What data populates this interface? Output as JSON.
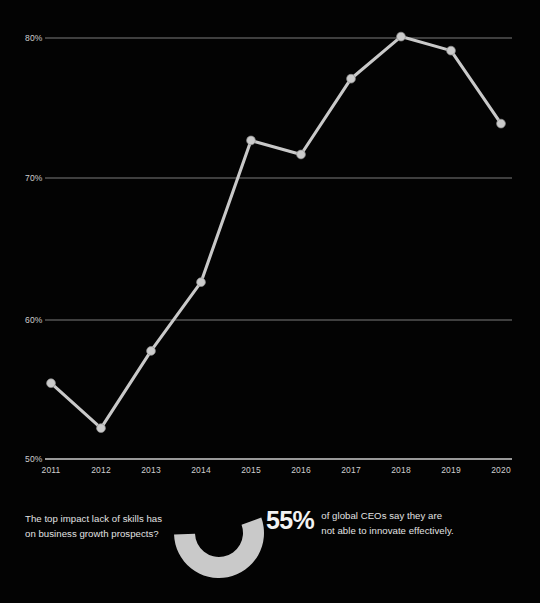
{
  "chart_data": {
    "type": "line",
    "title": "",
    "subtitle": "",
    "xlabel": "",
    "ylabel": "",
    "categories": [
      "2011",
      "2012",
      "2013",
      "2014",
      "2015",
      "2016",
      "2017",
      "2018",
      "2019",
      "2020"
    ],
    "series": [
      {
        "name": "CEOs confident in growth prospects",
        "values": [
          55.4,
          52.2,
          57.7,
          62.6,
          72.7,
          71.7,
          77.1,
          80.1,
          79.1,
          73.9
        ]
      }
    ],
    "ylim": [
      50,
      82
    ],
    "xlim": [
      "2011",
      "2020"
    ],
    "y_ticks": [
      50,
      60,
      70,
      80
    ],
    "y_tick_labels": [
      "50%",
      "60%",
      "70%",
      "80%"
    ],
    "x_tick_labels": [
      "2011",
      "2012",
      "2013",
      "2014",
      "2015",
      "2016",
      "2017",
      "2018",
      "2019",
      "2020"
    ],
    "grid": true,
    "grid_axis": "y",
    "legend": false,
    "legend_position": "none",
    "markers": true,
    "line_color": "#c9c9c9",
    "marker_color": "#cbcbcb",
    "grid_color": "#8a8a8a",
    "background_color": "#030303",
    "text_color": "#cfcfcf"
  },
  "donut_chart": {
    "type": "pie",
    "variant": "donut",
    "labels": [
      "Not able to innovate effectively",
      "Remainder"
    ],
    "values": [
      55,
      45
    ],
    "value_label": "55%",
    "colors": [
      "#c9c9c9",
      "#000000"
    ],
    "start_angle_deg": -20,
    "sweep_deg": 198
  },
  "callout": {
    "question_lines": [
      "The top impact lack of skills has",
      "on business growth prospects?"
    ],
    "stat_value": "55%",
    "stat_caption_lines": [
      "of global CEOs say they are",
      "not able to innovate effectively."
    ]
  },
  "colors": {
    "background": "#030303",
    "accent": "#c9c9c9",
    "text": "#e2e2e2",
    "grid": "#8a8a8a",
    "axis": "#cccccc"
  }
}
